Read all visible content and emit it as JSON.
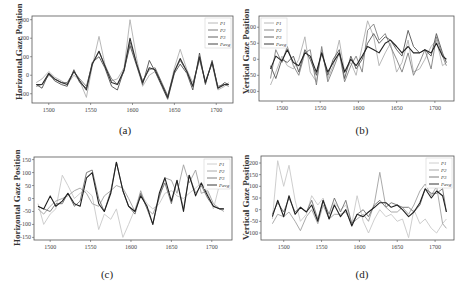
{
  "figure": {
    "captions": [
      "(a)",
      "(b)",
      "(c)",
      "(d)"
    ]
  },
  "chart_data": [
    {
      "type": "line",
      "panel": "a",
      "caption": "(a)",
      "title": "",
      "xlabel": "",
      "ylabel": "Horizontal Gaze Position",
      "xlim": [
        1480,
        1720
      ],
      "ylim": [
        -150,
        320
      ],
      "xticks": [
        1500,
        1550,
        1600,
        1650,
        1700
      ],
      "yticks": [
        -100,
        0,
        100,
        200,
        300
      ],
      "grid": false,
      "legend_position": "upper right",
      "legend": [
        "P1",
        "P2",
        "P3",
        "Pavg"
      ],
      "x": [
        1485,
        1492,
        1500,
        1507,
        1515,
        1522,
        1530,
        1537,
        1545,
        1552,
        1560,
        1567,
        1575,
        1582,
        1590,
        1597,
        1605,
        1612,
        1620,
        1627,
        1635,
        1642,
        1650,
        1657,
        1665,
        1672,
        1680,
        1687,
        1695,
        1702,
        1710,
        1715
      ],
      "series": [
        {
          "name": "P1",
          "color": "#b0b0b0",
          "values": [
            -40,
            -20,
            20,
            -10,
            -30,
            -50,
            0,
            -30,
            -120,
            50,
            210,
            60,
            -30,
            -20,
            40,
            300,
            90,
            -60,
            0,
            20,
            -50,
            -120,
            40,
            140,
            30,
            -40,
            80,
            -30,
            60,
            -80,
            -60,
            -40
          ]
        },
        {
          "name": "P2",
          "color": "#707070",
          "values": [
            -60,
            -50,
            0,
            -20,
            -40,
            -40,
            20,
            -20,
            -60,
            60,
            130,
            50,
            -20,
            -50,
            20,
            180,
            60,
            -30,
            30,
            40,
            -40,
            -110,
            20,
            80,
            20,
            -60,
            90,
            -40,
            70,
            -60,
            -50,
            -60
          ]
        },
        {
          "name": "P3",
          "color": "#505050",
          "values": [
            -50,
            -70,
            10,
            -30,
            -50,
            -60,
            30,
            -40,
            -70,
            70,
            100,
            40,
            -60,
            -80,
            30,
            160,
            50,
            -50,
            80,
            20,
            -60,
            -130,
            10,
            60,
            10,
            -80,
            120,
            -50,
            80,
            -70,
            -40,
            -50
          ]
        },
        {
          "name": "Pavg",
          "color": "#303030",
          "values": [
            -50,
            -50,
            10,
            -20,
            -40,
            -50,
            20,
            -30,
            -80,
            60,
            130,
            50,
            -40,
            -50,
            30,
            200,
            60,
            -40,
            40,
            30,
            -50,
            -120,
            20,
            90,
            20,
            -60,
            100,
            -40,
            70,
            -70,
            -50,
            -50
          ]
        }
      ]
    },
    {
      "type": "line",
      "panel": "b",
      "caption": "(b)",
      "title": "",
      "xlabel": "",
      "ylabel": "Vertical Gaze Position",
      "xlim": [
        1470,
        1725
      ],
      "ylim": [
        -130,
        135
      ],
      "xticks": [
        1500,
        1550,
        1600,
        1650,
        1700
      ],
      "yticks": [
        -100,
        -50,
        0,
        50,
        100
      ],
      "grid": false,
      "legend_position": "upper left",
      "legend": [
        "P1",
        "P2",
        "P3",
        "Pavg"
      ],
      "x": [
        1485,
        1492,
        1500,
        1507,
        1515,
        1522,
        1530,
        1537,
        1545,
        1552,
        1560,
        1567,
        1575,
        1582,
        1590,
        1597,
        1605,
        1612,
        1620,
        1627,
        1635,
        1642,
        1650,
        1657,
        1665,
        1672,
        1680,
        1687,
        1695,
        1702,
        1710,
        1715
      ],
      "series": [
        {
          "name": "P1",
          "color": "#b0b0b0",
          "values": [
            -80,
            -40,
            10,
            -20,
            -30,
            0,
            70,
            -40,
            -70,
            30,
            -60,
            -20,
            60,
            -40,
            -10,
            -50,
            40,
            120,
            70,
            -20,
            20,
            50,
            -40,
            -10,
            60,
            -40,
            -30,
            0,
            40,
            60,
            -20,
            -10
          ]
        },
        {
          "name": "P2",
          "color": "#808080",
          "values": [
            -60,
            30,
            -10,
            40,
            -20,
            -50,
            20,
            30,
            -80,
            40,
            -70,
            -30,
            20,
            -70,
            -20,
            10,
            -40,
            90,
            110,
            60,
            80,
            40,
            0,
            -40,
            20,
            -50,
            -10,
            30,
            -30,
            70,
            10,
            -20
          ]
        },
        {
          "name": "P3",
          "color": "#555555",
          "values": [
            -20,
            -60,
            0,
            -10,
            10,
            -40,
            30,
            0,
            -50,
            20,
            -50,
            0,
            30,
            -60,
            10,
            -30,
            0,
            50,
            80,
            50,
            70,
            60,
            30,
            10,
            90,
            40,
            20,
            30,
            10,
            80,
            20,
            -10
          ]
        },
        {
          "name": "Pavg",
          "color": "#222222",
          "values": [
            -30,
            10,
            -5,
            30,
            -10,
            -20,
            20,
            10,
            -40,
            20,
            -40,
            -10,
            20,
            -40,
            0,
            -20,
            10,
            40,
            30,
            20,
            50,
            60,
            40,
            20,
            40,
            20,
            20,
            30,
            20,
            50,
            10,
            0
          ]
        }
      ]
    },
    {
      "type": "line",
      "panel": "c",
      "caption": "(c)",
      "title": "",
      "xlabel": "",
      "ylabel": "Horizontal Gaze Position",
      "xlim": [
        1480,
        1725
      ],
      "ylim": [
        -160,
        160
      ],
      "xticks": [
        1500,
        1550,
        1600,
        1650,
        1700
      ],
      "yticks": [
        -150,
        -100,
        -50,
        0,
        50,
        100,
        150
      ],
      "grid": false,
      "legend_position": "upper right",
      "legend": [
        "P1",
        "P2",
        "P3",
        "Pavg"
      ],
      "x": [
        1485,
        1492,
        1500,
        1507,
        1515,
        1522,
        1530,
        1537,
        1545,
        1552,
        1560,
        1567,
        1575,
        1582,
        1590,
        1597,
        1605,
        1612,
        1620,
        1627,
        1635,
        1642,
        1650,
        1657,
        1665,
        1672,
        1680,
        1687,
        1695,
        1702,
        1710,
        1715
      ],
      "series": [
        {
          "name": "P1",
          "color": "#c8c8c8",
          "values": [
            -20,
            -100,
            -60,
            -40,
            90,
            50,
            0,
            20,
            30,
            10,
            -120,
            -60,
            -80,
            -40,
            -150,
            -100,
            -40,
            20,
            -20,
            -40,
            -20,
            20,
            30,
            10,
            0,
            20,
            40,
            60,
            20,
            -40,
            60,
            80
          ]
        },
        {
          "name": "P2",
          "color": "#a0a0a0",
          "values": [
            -40,
            -60,
            -30,
            -10,
            0,
            10,
            30,
            40,
            20,
            -20,
            -30,
            10,
            30,
            50,
            40,
            0,
            -50,
            30,
            -40,
            -60,
            0,
            80,
            70,
            20,
            130,
            60,
            110,
            20,
            30,
            -20,
            -40,
            -50
          ]
        },
        {
          "name": "P3",
          "color": "#707070",
          "values": [
            -30,
            -40,
            -50,
            -20,
            -20,
            20,
            -30,
            -10,
            100,
            110,
            0,
            -50,
            30,
            140,
            30,
            -30,
            -60,
            20,
            -40,
            -100,
            10,
            60,
            -20,
            70,
            -40,
            90,
            20,
            50,
            0,
            -30,
            -40,
            -40
          ]
        },
        {
          "name": "Pavg",
          "color": "#202020",
          "values": [
            -30,
            -40,
            10,
            -30,
            -10,
            20,
            -20,
            -30,
            80,
            100,
            -20,
            -50,
            20,
            140,
            30,
            -30,
            -50,
            10,
            -30,
            -100,
            20,
            80,
            -10,
            70,
            -50,
            90,
            10,
            60,
            10,
            -30,
            -40,
            -40
          ]
        }
      ]
    },
    {
      "type": "line",
      "panel": "d",
      "caption": "(d)",
      "title": "",
      "xlabel": "",
      "ylabel": "Vertical Gaze Position",
      "xlim": [
        1470,
        1725
      ],
      "ylim": [
        -130,
        230
      ],
      "xticks": [
        1500,
        1550,
        1600,
        1650,
        1700
      ],
      "yticks": [
        -100,
        -50,
        0,
        50,
        100,
        150,
        200
      ],
      "grid": false,
      "legend_position": "upper right",
      "legend": [
        "P1",
        "P2",
        "P3",
        "Pavg"
      ],
      "x": [
        1485,
        1492,
        1500,
        1507,
        1515,
        1522,
        1530,
        1537,
        1545,
        1552,
        1560,
        1567,
        1575,
        1582,
        1590,
        1597,
        1605,
        1612,
        1620,
        1627,
        1635,
        1642,
        1650,
        1657,
        1665,
        1672,
        1680,
        1687,
        1695,
        1702,
        1710,
        1715
      ],
      "series": [
        {
          "name": "P1",
          "color": "#c8c8c8",
          "values": [
            -40,
            210,
            100,
            190,
            40,
            -50,
            -20,
            60,
            20,
            50,
            -40,
            30,
            0,
            20,
            -60,
            60,
            -50,
            -100,
            -40,
            0,
            -30,
            -20,
            -50,
            -40,
            -120,
            0,
            -60,
            -40,
            -80,
            -100,
            -60,
            -40
          ]
        },
        {
          "name": "P2",
          "color": "#a0a0a0",
          "values": [
            -60,
            -20,
            -30,
            -10,
            -50,
            -90,
            -30,
            0,
            -60,
            20,
            -40,
            -20,
            -20,
            -10,
            -60,
            -40,
            -20,
            -50,
            30,
            160,
            10,
            -10,
            -10,
            10,
            -20,
            20,
            80,
            110,
            60,
            100,
            -60,
            -80
          ]
        },
        {
          "name": "P3",
          "color": "#707070",
          "values": [
            -20,
            30,
            -10,
            50,
            -10,
            10,
            -10,
            40,
            -40,
            40,
            -20,
            50,
            -10,
            40,
            -60,
            -20,
            0,
            -30,
            20,
            40,
            10,
            30,
            20,
            10,
            10,
            -10,
            20,
            90,
            70,
            70,
            90,
            -10
          ]
        },
        {
          "name": "Pavg",
          "color": "#202020",
          "values": [
            -30,
            40,
            -30,
            60,
            -20,
            10,
            -10,
            20,
            -50,
            40,
            -40,
            20,
            -30,
            0,
            -70,
            -20,
            -30,
            -10,
            10,
            30,
            30,
            10,
            20,
            0,
            -30,
            -10,
            30,
            90,
            50,
            80,
            60,
            -10
          ]
        }
      ]
    }
  ]
}
